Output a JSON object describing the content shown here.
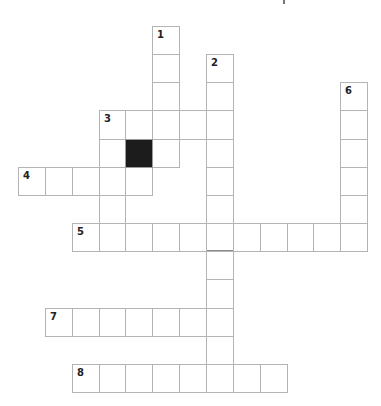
{
  "puzzle": {
    "type": "crossword",
    "grid_origin": {
      "x": 18,
      "y": 26
    },
    "cell_width": 26.85,
    "cell_height": 28.15,
    "colors": {
      "line": "#b4b4b4",
      "block": "#1c1c1c",
      "background": "#ffffff",
      "number": "#222222"
    },
    "words": [
      {
        "number": "1",
        "direction": "down",
        "col": 5,
        "row": 0,
        "length": 5
      },
      {
        "number": "2",
        "direction": "down",
        "col": 7,
        "row": 1,
        "length": 12
      },
      {
        "number": "3",
        "direction": "across",
        "col": 3,
        "row": 3,
        "length": 5
      },
      {
        "number": "3",
        "direction": "down",
        "col": 3,
        "row": 3,
        "length": 5
      },
      {
        "number": "4",
        "direction": "across",
        "col": 0,
        "row": 5,
        "length": 5
      },
      {
        "number": "5",
        "direction": "across",
        "col": 2,
        "row": 7,
        "length": 11
      },
      {
        "number": "6",
        "direction": "down",
        "col": 12,
        "row": 2,
        "length": 6
      },
      {
        "number": "7",
        "direction": "across",
        "col": 1,
        "row": 10,
        "length": 7
      },
      {
        "number": "8",
        "direction": "across",
        "col": 2,
        "row": 12,
        "length": 8
      }
    ],
    "blocks": [
      {
        "col": 4,
        "row": 4
      }
    ],
    "dark_bottom_cells": [
      {
        "col": 7,
        "row": 7
      }
    ]
  }
}
